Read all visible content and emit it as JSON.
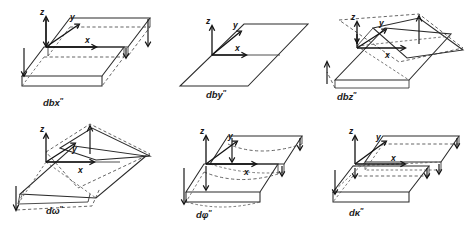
{
  "figure": {
    "title": "",
    "background_color": "#ffffff",
    "line_color": "#2b2b2b",
    "dashed_color": "#4a4a4a",
    "rows": 2,
    "columns": 3
  },
  "axis_labels": {
    "x": "x",
    "y": "y",
    "z": "z"
  },
  "panels": [
    {
      "id": "panel-dbx",
      "caption_base": "dbx",
      "caption_prime": "″",
      "caption": "dbx″",
      "axes": [
        "z",
        "y",
        "x"
      ],
      "deformation": "translation-along-x",
      "description": "Two parallel parallelogram plates, upper plate offset, vertical arrows down at corners"
    },
    {
      "id": "panel-dby",
      "caption_base": "dby",
      "caption_prime": "″",
      "caption": "dby″",
      "axes": [
        "z",
        "y",
        "x"
      ],
      "deformation": "translation-along-y",
      "description": "Single flat parallelogram plane with origin axes"
    },
    {
      "id": "panel-dbz",
      "caption_base": "dbz",
      "caption_prime": "″",
      "caption": "dbz″",
      "axes": [
        "z",
        "y",
        "x"
      ],
      "deformation": "translation-along-z",
      "description": "Twisted parallelogram, back corner raised, front corner lowered, vertical arrows"
    },
    {
      "id": "panel-domega",
      "caption_base": "dω",
      "caption_prime": "″",
      "caption": "dω″",
      "axes": [
        "z",
        "y",
        "x"
      ],
      "deformation": "rotation-about-x",
      "description": "Plane rotated about x axis, back edge up, front edge down"
    },
    {
      "id": "panel-dphi",
      "caption_base": "dφ",
      "caption_prime": "″",
      "caption": "dφ″",
      "axes": [
        "z",
        "y",
        "x"
      ],
      "deformation": "rotation-about-y",
      "description": "Plate with curved bowed dashed edges, rotation about y axis"
    },
    {
      "id": "panel-dkappa",
      "caption_base": "dκ",
      "caption_prime": "″",
      "caption": "dκ″",
      "axes": [
        "z",
        "y",
        "x"
      ],
      "deformation": "rotation-about-z",
      "description": "Two offset parallelogram plates sheared, rotation about z axis"
    }
  ]
}
